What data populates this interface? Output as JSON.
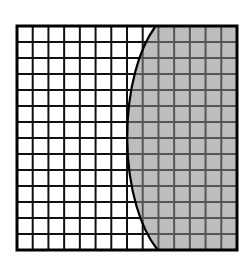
{
  "figure": {
    "description": "14 by 14 square grid with a curved boundary; region to the right of the curve is shaded gray",
    "grid": {
      "rows": 14,
      "cols": 14,
      "x": 17,
      "y": 26,
      "width": 220,
      "height": 224
    },
    "curve": {
      "type": "elliptical-arc",
      "start": [
        155,
        27
      ],
      "end": [
        157,
        249
      ],
      "rx": 60,
      "ry": 130
    },
    "colors": {
      "background": "#ffffff",
      "shaded_fill": "#bdbdbd",
      "grid_line": "#111111",
      "grid_line_shaded": "#555555",
      "border": "#000000",
      "curve": "#000000"
    }
  }
}
